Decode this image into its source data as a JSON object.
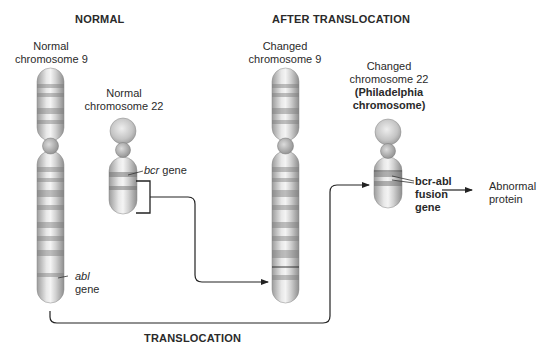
{
  "headers": {
    "normal": "NORMAL",
    "after": "AFTER TRANSLOCATION",
    "translocation": "TRANSLOCATION"
  },
  "normal_chr9": {
    "line1": "Normal",
    "line2": "chromosome 9"
  },
  "normal_chr22": {
    "line1": "Normal",
    "line2": "chromosome 22"
  },
  "changed_chr9": {
    "line1": "Changed",
    "line2": "chromosome 9"
  },
  "changed_chr22": {
    "line1": "Changed",
    "line2": "chromosome 22",
    "line3": "(Philadelphia",
    "line4": "chromosome)"
  },
  "genes": {
    "bcr_italic": "bcr",
    "bcr_suffix": " gene",
    "abl_italic": "abl",
    "abl_suffix": "gene",
    "fusion_line1": "bcr-abl",
    "fusion_line2": "fusion",
    "fusion_line3": "gene"
  },
  "result": {
    "line1": "Abnormal",
    "line2": "protein"
  },
  "colors": {
    "line": "#222222",
    "chromosome_light": "#e6e6e6",
    "chromosome_dark": "#8a8a8a",
    "band": "#9a9a9a"
  }
}
